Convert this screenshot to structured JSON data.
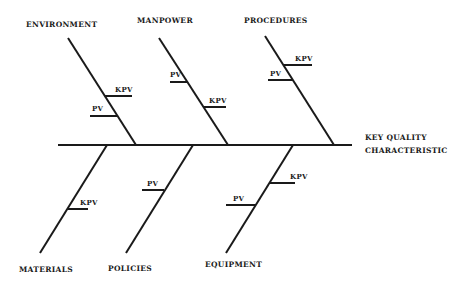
{
  "diagram": {
    "type": "fishbone",
    "line_color": "#1a1a1a",
    "effect": {
      "line1": "KEY  QUALITY",
      "line2": "CHARACTERISTIC"
    },
    "categories": {
      "environment": "ENVIRONMENT",
      "manpower": "MANPOWER",
      "procedures": "PROCEDURES",
      "materials": "MATERIALS",
      "policies": "POLICIES",
      "equipment": "EQUIPMENT"
    },
    "tick_labels": {
      "kpv": "KPV",
      "pv": "PV"
    }
  }
}
